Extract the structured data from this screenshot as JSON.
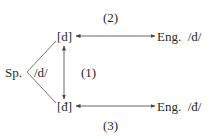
{
  "diagram": {
    "source": {
      "label": "Sp.",
      "phoneme": "/d/"
    },
    "allophones": [
      {
        "id": "top",
        "label": "[d]"
      },
      {
        "id": "bottom",
        "label": "[đ]"
      }
    ],
    "targets": [
      {
        "id": "eng-d",
        "label": "Eng.",
        "phoneme": "/d/"
      },
      {
        "id": "eng-dh",
        "label": "Eng.",
        "phoneme": "/đ/"
      }
    ],
    "relations": [
      {
        "label": "(1)",
        "from": "[d]",
        "to": "[đ]",
        "type": "bidirectional"
      },
      {
        "label": "(2)",
        "from": "[d]",
        "to": "Eng. /d/",
        "type": "bidirectional"
      },
      {
        "label": "(3)",
        "from": "[đ]",
        "to": "Eng. /đ/",
        "type": "bidirectional"
      }
    ],
    "colors": {
      "ink": "#2a2a2a",
      "background": "#ffffff"
    }
  }
}
